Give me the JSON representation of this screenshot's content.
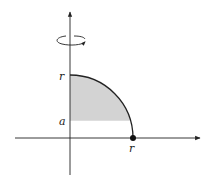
{
  "diagram": {
    "labels": {
      "y_top": "r",
      "y_level": "a",
      "x_end": "r"
    },
    "colors": {
      "shade": "#d3d3d3",
      "stroke": "#222222",
      "background": "#ffffff"
    },
    "geometry": {
      "origin": [
        70,
        138
      ],
      "radius_px": 63,
      "a_level_y": 121
    }
  }
}
